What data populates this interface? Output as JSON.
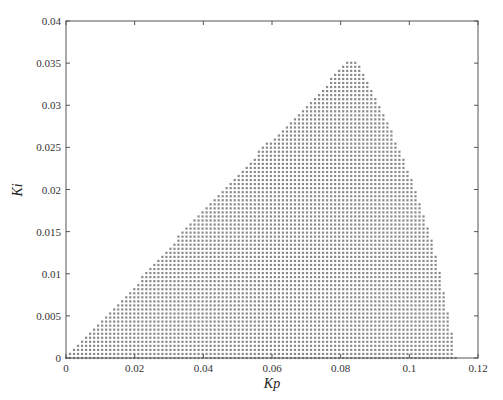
{
  "chart_data": {
    "type": "scatter",
    "title": "",
    "xlabel": "Kp",
    "ylabel": "Ki",
    "xlim": [
      0,
      0.12
    ],
    "ylim": [
      0,
      0.04
    ],
    "x_ticks": [
      "0",
      "0.02",
      "0.04",
      "0.06",
      "0.08",
      "0.1",
      "0.12"
    ],
    "y_ticks": [
      "0",
      "0.005",
      "0.01",
      "0.015",
      "0.02",
      "0.025",
      "0.03",
      "0.035",
      "0.04"
    ],
    "grid": false,
    "legend": null,
    "marker_color": "#8a8a8a",
    "region_boundary": {
      "left": [
        {
          "Ki": 0.0,
          "Kp": 0.0
        },
        {
          "Ki": 0.005,
          "Kp": 0.012
        },
        {
          "Ki": 0.01,
          "Kp": 0.023
        },
        {
          "Ki": 0.015,
          "Kp": 0.034
        },
        {
          "Ki": 0.02,
          "Kp": 0.046
        },
        {
          "Ki": 0.025,
          "Kp": 0.0573
        },
        {
          "Ki": 0.03,
          "Kp": 0.0705
        },
        {
          "Ki": 0.0355,
          "Kp": 0.0823
        }
      ],
      "right": [
        {
          "Ki": 0.0,
          "Kp": 0.1135
        },
        {
          "Ki": 0.005,
          "Kp": 0.1115
        },
        {
          "Ki": 0.01,
          "Kp": 0.109
        },
        {
          "Ki": 0.015,
          "Kp": 0.1058
        },
        {
          "Ki": 0.02,
          "Kp": 0.1018
        },
        {
          "Ki": 0.025,
          "Kp": 0.097
        },
        {
          "Ki": 0.03,
          "Kp": 0.0912
        },
        {
          "Ki": 0.0355,
          "Kp": 0.0845
        }
      ],
      "peak": {
        "Kp": 0.0833,
        "Ki": 0.0355
      }
    },
    "grid_step": {
      "Kp": 0.00117,
      "Ki": 0.00048
    }
  }
}
